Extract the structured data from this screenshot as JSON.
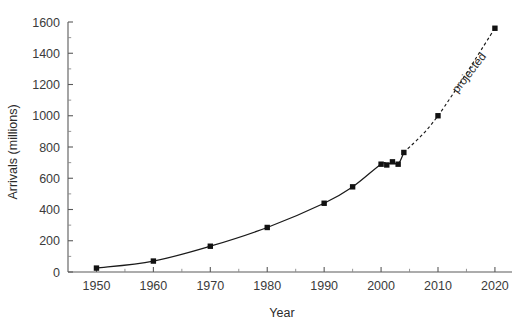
{
  "chart_data": {
    "type": "line",
    "title": "",
    "xlabel": "Year",
    "ylabel": "Arrivals (millions)",
    "xlim": [
      1945,
      2023
    ],
    "ylim": [
      0,
      1600
    ],
    "grid": false,
    "legend": null,
    "x_ticks": [
      1950,
      1960,
      1970,
      1980,
      1990,
      2000,
      2010,
      2020
    ],
    "x_tick_labels": [
      "1950",
      "1960",
      "1970",
      "1980",
      "1990",
      "2000",
      "2010",
      "2020"
    ],
    "x_minor_step": 5,
    "y_ticks": [
      0,
      200,
      400,
      600,
      800,
      1000,
      1200,
      1400,
      1600
    ],
    "y_tick_labels": [
      "0",
      "200",
      "400",
      "600",
      "800",
      "1000",
      "1200",
      "1400",
      "1600"
    ],
    "y_minor_step": 100,
    "series": [
      {
        "name": "actual",
        "style": "solid",
        "marker": "square",
        "x": [
          1950,
          1960,
          1970,
          1980,
          1990,
          1995,
          2000,
          2001,
          2002,
          2003,
          2004
        ],
        "values": [
          25,
          70,
          165,
          285,
          440,
          545,
          690,
          685,
          705,
          690,
          765
        ]
      },
      {
        "name": "projected",
        "style": "dashed",
        "marker": "square",
        "x": [
          2004,
          2010,
          2020
        ],
        "values": [
          765,
          1000,
          1560
        ]
      }
    ],
    "annotations": [
      {
        "text": "projected",
        "x": 2016,
        "y": 1260,
        "rotation": -52
      }
    ]
  },
  "axis_labels": {
    "x_title": "Year",
    "y_title": "Arrivals (millions)"
  },
  "colors": {
    "line": "#1a1a1a",
    "marker": "#111111",
    "axis": "#5a5a5a",
    "text": "#2b2b2b",
    "background": "#ffffff"
  }
}
